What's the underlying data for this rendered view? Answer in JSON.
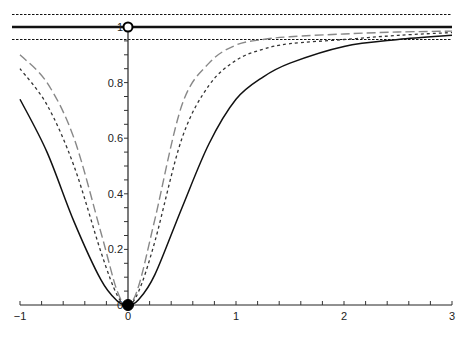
{
  "chart_data": {
    "type": "line",
    "title": "",
    "xlabel": "",
    "ylabel": "",
    "xlim": [
      -1,
      3
    ],
    "ylim": [
      0,
      1
    ],
    "grid": false,
    "legend": null,
    "x_ticks": [
      "-1",
      "0",
      "1",
      "2",
      "3"
    ],
    "y_ticks": [
      "0",
      "0.2",
      "0.4",
      "0.6",
      "0.8",
      "1"
    ],
    "x": [
      -1,
      -0.75,
      -0.5,
      -0.25,
      -0.1,
      0,
      0.1,
      0.25,
      0.5,
      0.75,
      1,
      1.25,
      1.5,
      2,
      2.5,
      3
    ],
    "series": [
      {
        "name": "solid",
        "style": "solid",
        "color": "#111111",
        "values": [
          0.74,
          0.55,
          0.3,
          0.09,
          0.015,
          0,
          0.02,
          0.11,
          0.35,
          0.58,
          0.74,
          0.82,
          0.87,
          0.93,
          0.955,
          0.97
        ]
      },
      {
        "name": "short-dashed",
        "style": "dotted",
        "color": "#333333",
        "values": [
          0.85,
          0.72,
          0.5,
          0.19,
          0.035,
          0,
          0.05,
          0.23,
          0.6,
          0.79,
          0.88,
          0.92,
          0.94,
          0.955,
          0.97,
          0.98
        ]
      },
      {
        "name": "long-dashed",
        "style": "dashed",
        "color": "#888888",
        "values": [
          0.9,
          0.8,
          0.6,
          0.26,
          0.05,
          0,
          0.07,
          0.31,
          0.72,
          0.87,
          0.935,
          0.955,
          0.965,
          0.975,
          0.982,
          0.985
        ]
      }
    ],
    "reference_lines": [
      {
        "name": "limit",
        "y": 1.0,
        "style": "thick-solid"
      },
      {
        "name": "upper-band",
        "y": 1.045,
        "style": "dotted"
      },
      {
        "name": "lower-band",
        "y": 0.955,
        "style": "dotted"
      }
    ],
    "markers": [
      {
        "name": "open-circle",
        "x": 0,
        "y": 1
      },
      {
        "name": "filled-circle",
        "x": 0,
        "y": 0
      }
    ]
  }
}
